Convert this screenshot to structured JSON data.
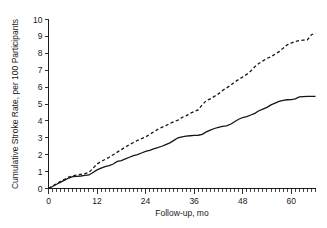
{
  "chart_data": {
    "type": "line",
    "title": "",
    "subtitle": "",
    "xlabel": "Follow-up, mo",
    "ylabel": "Cumulative Stroke Rate, per 100 Participants",
    "xlim": [
      0,
      66
    ],
    "ylim": [
      0,
      10
    ],
    "xticks": [
      0,
      12,
      24,
      36,
      48,
      60
    ],
    "xticklabels": [
      "0",
      "12",
      "24",
      "36",
      "48",
      "60"
    ],
    "xminor_tick_interval": 1,
    "yticks": [
      0,
      1,
      2,
      3,
      4,
      5,
      6,
      7,
      8,
      9,
      10
    ],
    "yticklabels": [
      "0",
      "1",
      "2",
      "3",
      "4",
      "5",
      "6",
      "7",
      "8",
      "9",
      "10"
    ],
    "grid": false,
    "legend": "none",
    "annotations": [],
    "series": [
      {
        "name": "solid-curve",
        "style": "solid",
        "color": "#161616",
        "x": [
          0,
          1,
          2,
          3,
          4,
          5,
          6,
          7,
          8,
          9,
          10,
          11,
          12,
          13,
          14,
          15,
          16,
          17,
          18,
          19,
          20,
          21,
          22,
          23,
          24,
          25,
          26,
          27,
          28,
          29,
          30,
          31,
          32,
          33,
          34,
          35,
          36,
          37,
          38,
          39,
          40,
          41,
          42,
          43,
          44,
          45,
          46,
          47,
          48,
          49,
          50,
          51,
          52,
          53,
          54,
          55,
          56,
          57,
          58,
          59,
          60,
          61,
          62,
          63,
          64,
          65,
          66
        ],
        "y": [
          0.0,
          0.12,
          0.25,
          0.38,
          0.5,
          0.62,
          0.7,
          0.72,
          0.74,
          0.78,
          0.8,
          0.95,
          1.1,
          1.2,
          1.3,
          1.35,
          1.45,
          1.6,
          1.65,
          1.75,
          1.85,
          1.95,
          2.0,
          2.1,
          2.2,
          2.25,
          2.35,
          2.42,
          2.5,
          2.6,
          2.7,
          2.85,
          3.0,
          3.05,
          3.1,
          3.12,
          3.14,
          3.15,
          3.2,
          3.35,
          3.45,
          3.55,
          3.62,
          3.68,
          3.7,
          3.8,
          3.95,
          4.1,
          4.2,
          4.25,
          4.35,
          4.45,
          4.6,
          4.7,
          4.8,
          4.95,
          5.05,
          5.15,
          5.22,
          5.25,
          5.26,
          5.3,
          5.42,
          5.44,
          5.45,
          5.45,
          5.45
        ]
      },
      {
        "name": "dashed-curve",
        "style": "dashed",
        "color": "#161616",
        "x": [
          0,
          1,
          2,
          3,
          4,
          5,
          6,
          7,
          8,
          9,
          10,
          11,
          12,
          13,
          14,
          15,
          16,
          17,
          18,
          19,
          20,
          21,
          22,
          23,
          24,
          25,
          26,
          27,
          28,
          29,
          30,
          31,
          32,
          33,
          34,
          35,
          36,
          37,
          38,
          39,
          40,
          41,
          42,
          43,
          44,
          45,
          46,
          47,
          48,
          49,
          50,
          51,
          52,
          53,
          54,
          55,
          56,
          57,
          58,
          59,
          60,
          61,
          62,
          63,
          64,
          65,
          66
        ],
        "y": [
          0.0,
          0.14,
          0.28,
          0.42,
          0.55,
          0.68,
          0.76,
          0.8,
          0.84,
          0.88,
          0.95,
          1.2,
          1.45,
          1.6,
          1.72,
          1.85,
          2.0,
          2.15,
          2.3,
          2.45,
          2.6,
          2.72,
          2.85,
          2.95,
          3.05,
          3.2,
          3.35,
          3.5,
          3.62,
          3.72,
          3.85,
          3.95,
          4.05,
          4.2,
          4.3,
          4.45,
          4.55,
          4.65,
          4.95,
          5.2,
          5.3,
          5.45,
          5.6,
          5.8,
          5.95,
          6.1,
          6.3,
          6.45,
          6.6,
          6.75,
          6.95,
          7.2,
          7.4,
          7.55,
          7.7,
          7.8,
          7.95,
          8.1,
          8.3,
          8.5,
          8.6,
          8.7,
          8.75,
          8.78,
          8.8,
          9.1,
          9.2
        ]
      }
    ]
  },
  "figure": {
    "background_color": "#ffffff",
    "foreground_color": "#1a1a1a"
  }
}
